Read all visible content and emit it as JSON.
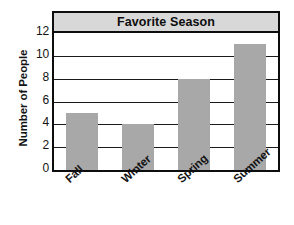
{
  "chart_data": {
    "type": "bar",
    "title": "Favorite Season",
    "xlabel": "",
    "ylabel": "Number of People",
    "categories": [
      "Fall",
      "Winter",
      "Spring",
      "Summer"
    ],
    "values": [
      5,
      4,
      8,
      11
    ],
    "ylim": [
      0,
      12
    ],
    "ytick_labels": [
      "0",
      "2",
      "4",
      "6",
      "8",
      "10",
      "12"
    ],
    "ytick_values": [
      0,
      2,
      4,
      6,
      8,
      10,
      12
    ],
    "grid": true,
    "legend": false,
    "legend_position": "none",
    "series": [
      {
        "name": "Number of People",
        "values": [
          5,
          4,
          8,
          11
        ]
      }
    ],
    "colors": {
      "bar_fill": "#a8a8a8",
      "title_banner": "#d8d8d8",
      "frame": "#0d0d0d",
      "gridline": "#1a1a1a",
      "text": "#131313",
      "background": "#ffffff"
    }
  }
}
